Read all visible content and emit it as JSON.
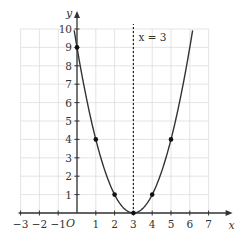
{
  "chart_data": {
    "type": "line",
    "title": "",
    "function": "y = (x - 3)^2",
    "xlabel": "x",
    "ylabel": "y",
    "xlim": [
      -3,
      7
    ],
    "ylim": [
      0,
      10
    ],
    "origin_label": "O",
    "x_ticks": [
      -3,
      -2,
      -1,
      1,
      2,
      3,
      4,
      5,
      6,
      7
    ],
    "x_tick_labels": [
      "−3",
      "−2",
      "−1",
      "1",
      "2",
      "3",
      "4",
      "5",
      "6",
      "7"
    ],
    "y_ticks": [
      1,
      2,
      3,
      4,
      5,
      6,
      7,
      8,
      9,
      10
    ],
    "y_tick_labels": [
      "1",
      "2",
      "3",
      "4",
      "5",
      "6",
      "7",
      "8",
      "9",
      "10"
    ],
    "grid": true,
    "series": [
      {
        "name": "y = (x-3)^2",
        "points": [
          [
            0,
            9
          ],
          [
            1,
            4
          ],
          [
            2,
            1
          ],
          [
            3,
            0
          ],
          [
            4,
            1
          ],
          [
            5,
            4
          ]
        ]
      }
    ],
    "annotations": [
      {
        "type": "vertical_dashed_line",
        "x": 3,
        "label": "x = 3"
      }
    ],
    "colors": {
      "curve": "#333333",
      "grid": "#dddddd",
      "axis": "#333333"
    }
  }
}
